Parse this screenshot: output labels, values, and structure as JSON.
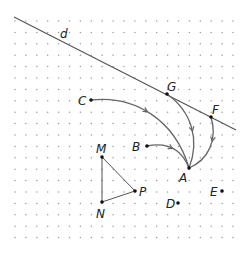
{
  "grid": {
    "x0": 15,
    "y0": 21,
    "dx": 10.9,
    "dy": 11.4,
    "cols": 21,
    "rows": 20,
    "dot_color": "#9a9a9a"
  },
  "line_d": {
    "label": "d",
    "x1": 14,
    "y1": 17,
    "x2": 236,
    "y2": 130,
    "label_x": 60,
    "label_y": 38
  },
  "points": [
    {
      "id": "C",
      "label": "C",
      "x": 91,
      "y": 100,
      "lx": 78,
      "ly": 105
    },
    {
      "id": "G",
      "label": "G",
      "x": 167,
      "y": 94,
      "lx": 167,
      "ly": 91
    },
    {
      "id": "F",
      "label": "F",
      "x": 211,
      "y": 117,
      "lx": 212,
      "ly": 114
    },
    {
      "id": "B",
      "label": "B",
      "x": 147,
      "y": 146,
      "lx": 132,
      "ly": 151
    },
    {
      "id": "A",
      "label": "A",
      "x": 189,
      "y": 168,
      "lx": 179,
      "ly": 182
    },
    {
      "id": "M",
      "label": "M",
      "x": 102,
      "y": 157,
      "lx": 96,
      "ly": 153
    },
    {
      "id": "N",
      "label": "N",
      "x": 102,
      "y": 202,
      "lx": 96,
      "ly": 218
    },
    {
      "id": "P",
      "label": "P",
      "x": 135,
      "y": 191,
      "lx": 139,
      "ly": 196
    },
    {
      "id": "D",
      "label": "D",
      "x": 178,
      "y": 203,
      "lx": 166,
      "ly": 208
    },
    {
      "id": "E",
      "label": "E",
      "x": 222,
      "y": 191,
      "lx": 210,
      "ly": 196
    }
  ],
  "arcs": [
    {
      "from": "C",
      "to": "A",
      "path": "M91,100 C135,95 175,120 189,168",
      "arrow_at": 0.45
    },
    {
      "from": "G",
      "to": "A",
      "path": "M167,94 C192,112 200,140 189,168",
      "arrow_at": 0.55
    },
    {
      "from": "F",
      "to": "A",
      "path": "M211,117 C218,140 208,160 189,168",
      "arrow_at": 0.4
    },
    {
      "from": "B",
      "to": "A",
      "path": "M147,146 C168,142 182,150 189,168",
      "arrow_at": 0.5
    }
  ],
  "triangle": {
    "vertices": [
      "M",
      "P",
      "N"
    ]
  },
  "colors": {
    "line": "#555555",
    "arc": "#666666",
    "point": "#111111",
    "label": "#222222"
  }
}
